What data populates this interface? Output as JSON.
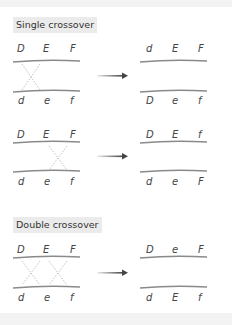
{
  "sections": [
    {
      "title": "Single crossover",
      "rows": [
        {
          "before": {
            "top": [
              "D",
              "E",
              "F"
            ],
            "bottom": [
              "d",
              "e",
              "f"
            ]
          },
          "crossover_between": [
            [
              0,
              1
            ]
          ],
          "after": {
            "top": [
              "d",
              "E",
              "F"
            ],
            "bottom": [
              "D",
              "e",
              "f"
            ]
          }
        },
        {
          "before": {
            "top": [
              "D",
              "E",
              "F"
            ],
            "bottom": [
              "d",
              "e",
              "f"
            ]
          },
          "crossover_between": [
            [
              1,
              2
            ]
          ],
          "after": {
            "top": [
              "D",
              "E",
              "f"
            ],
            "bottom": [
              "d",
              "e",
              "F"
            ]
          }
        }
      ]
    },
    {
      "title": "Double crossover",
      "rows": [
        {
          "before": {
            "top": [
              "D",
              "E",
              "F"
            ],
            "bottom": [
              "d",
              "e",
              "f"
            ]
          },
          "crossover_between": [
            [
              0,
              1
            ],
            [
              1,
              2
            ]
          ],
          "after": {
            "top": [
              "D",
              "e",
              "F"
            ],
            "bottom": [
              "d",
              "E",
              "f"
            ]
          }
        }
      ]
    }
  ],
  "colors": {
    "chromosome": "#8a8a8a",
    "crossover": "#b0b0b0",
    "arrow": "#444444",
    "label_bg": "#ebebeb"
  }
}
